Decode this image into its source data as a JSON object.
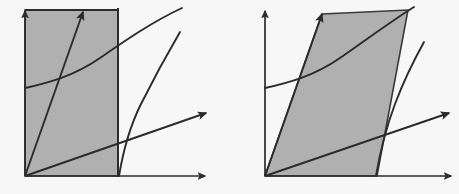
{
  "figure": {
    "background_color": "#f7f7f7",
    "shade_color": "#b0b0b0",
    "ink_color": "#2b2b2b",
    "width": 459,
    "height": 194
  },
  "panels": [
    {
      "id": "left-panel",
      "name": "rectangular-region-panel",
      "region_shape": "rectangle",
      "origin": {
        "x": 25,
        "y": 176
      },
      "y_axis": {
        "x1": 25,
        "y1": 176,
        "x2": 25,
        "y2": 10,
        "arrow": "up"
      },
      "x_axis": {
        "x1": 25,
        "y1": 176,
        "x2": 206,
        "y2": 176,
        "arrow": "right"
      },
      "region_points": "25,176 25,10 118,10 118,176",
      "region_right_edge_x": 118,
      "region_top_y": 10,
      "diagonal_ray": {
        "x1": 25,
        "y1": 176,
        "x2": 83,
        "y2": 10,
        "arrow": "up-right",
        "label": "steep-ray"
      },
      "shallow_ray": {
        "x1": 25,
        "y1": 176,
        "x2": 208,
        "y2": 113,
        "arrow": "right-up",
        "label": "shallow-ray"
      },
      "concave_curve": {
        "start": "25,88",
        "control": "90,76",
        "end": "182,8",
        "label": "rising-concave-curve"
      },
      "steep_curve": {
        "start": "119,176",
        "control": "141,100",
        "end": "180,32",
        "label": "steep-rising-curve"
      }
    },
    {
      "id": "right-panel",
      "name": "parallelogram-region-panel",
      "region_shape": "parallelogram",
      "origin": {
        "x": 265,
        "y": 176
      },
      "y_axis": {
        "x1": 265,
        "y1": 176,
        "x2": 265,
        "y2": 10,
        "arrow": "up"
      },
      "x_axis": {
        "x1": 265,
        "y1": 176,
        "x2": 452,
        "y2": 176,
        "arrow": "right"
      },
      "region_points": "265,176 322,14 408,10 377,176",
      "region_shear": "sheared right",
      "diagonal_ray": {
        "x1": 265,
        "y1": 176,
        "x2": 322,
        "y2": 12,
        "arrow": "up-right",
        "label": "steep-ray"
      },
      "shallow_ray": {
        "x1": 265,
        "y1": 176,
        "x2": 450,
        "y2": 113,
        "arrow": "right-up",
        "label": "shallow-ray"
      },
      "concave_curve": {
        "start": "265,88",
        "control": "330,76",
        "end": "412,8",
        "label": "rising-concave-curve"
      },
      "steep_curve": {
        "start": "376,176",
        "control": "393,104",
        "end": "424,42",
        "label": "steep-rising-curve"
      }
    }
  ],
  "legend": {
    "visible": false,
    "entries": []
  },
  "annotations": {
    "labels": [],
    "tick_labels": []
  }
}
